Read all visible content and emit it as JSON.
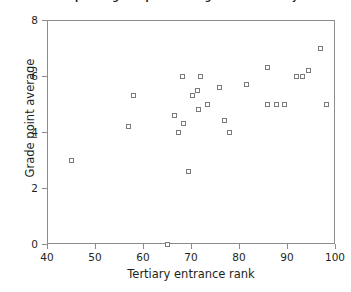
{
  "chart_data": {
    "type": "scatter",
    "title": "Scatter plot of grade point average versus tertiary entrance rank for first-year science students",
    "xlabel": "Tertiary entrance rank",
    "ylabel": "Grade point average",
    "xlim": [
      40,
      100
    ],
    "ylim": [
      0,
      8
    ],
    "xticks": [
      40,
      50,
      60,
      70,
      80,
      90,
      100
    ],
    "yticks": [
      0,
      2,
      4,
      6,
      8
    ],
    "grid": false,
    "legend": null,
    "marker": {
      "shape": "open-square",
      "edge_color": "#7a7a7a",
      "fill_color": "#ffffff",
      "size_px": 5
    },
    "frame_color": "#8c8c8c",
    "points": [
      {
        "x": 45.0,
        "y": 3.0
      },
      {
        "x": 57.0,
        "y": 4.2
      },
      {
        "x": 58.0,
        "y": 5.3
      },
      {
        "x": 65.0,
        "y": 0.0
      },
      {
        "x": 66.5,
        "y": 4.6
      },
      {
        "x": 67.3,
        "y": 4.0
      },
      {
        "x": 68.5,
        "y": 4.3
      },
      {
        "x": 68.3,
        "y": 6.0
      },
      {
        "x": 69.5,
        "y": 2.6
      },
      {
        "x": 70.3,
        "y": 5.3
      },
      {
        "x": 71.3,
        "y": 5.5
      },
      {
        "x": 71.5,
        "y": 4.8
      },
      {
        "x": 72.0,
        "y": 6.0
      },
      {
        "x": 73.5,
        "y": 5.0
      },
      {
        "x": 76.0,
        "y": 5.6
      },
      {
        "x": 77.0,
        "y": 4.4
      },
      {
        "x": 78.0,
        "y": 4.0
      },
      {
        "x": 81.5,
        "y": 5.7
      },
      {
        "x": 86.0,
        "y": 6.3
      },
      {
        "x": 86.0,
        "y": 5.0
      },
      {
        "x": 87.8,
        "y": 5.0
      },
      {
        "x": 89.5,
        "y": 5.0
      },
      {
        "x": 92.0,
        "y": 6.0
      },
      {
        "x": 93.3,
        "y": 6.0
      },
      {
        "x": 94.5,
        "y": 6.2
      },
      {
        "x": 97.0,
        "y": 7.0
      },
      {
        "x": 98.3,
        "y": 5.0
      }
    ]
  }
}
